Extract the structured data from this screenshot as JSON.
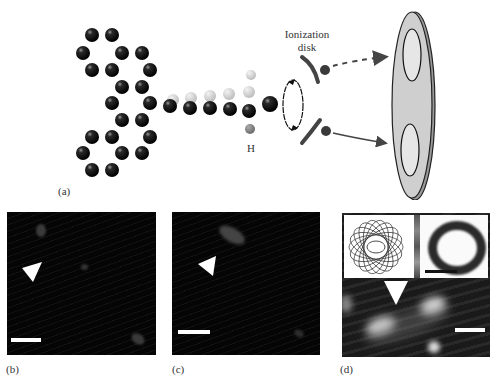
{
  "figure": {
    "panel_labels": {
      "a": "(a)",
      "b": "(b)",
      "c": "(c)",
      "d": "(d)"
    },
    "annotations": {
      "ionization_disk_line1": "Ionization",
      "ionization_disk_line2": "disk",
      "hydrogen": "H"
    },
    "colors": {
      "carbon_atom": "#111111",
      "faded_atom": "#c8c8c8",
      "hydrogen_atom": "#7a7a7a",
      "detector_fill": "#cfcfcf",
      "detector_inner_fill": "#e6e6e6",
      "image_background": "#050505",
      "arrow": "#444444"
    },
    "panels": [
      {
        "id": "b",
        "type": "microscope-image",
        "has_arrowhead_marker": true,
        "has_scale_bar": true
      },
      {
        "id": "c",
        "type": "microscope-image",
        "has_arrowhead_marker": true,
        "has_scale_bar": true
      },
      {
        "id": "d",
        "type": "composite-image",
        "insets": [
          "orbital-trajectory-drawing",
          "ring-image"
        ],
        "has_arrowhead_marker": true,
        "has_scale_bars": 2
      }
    ]
  }
}
